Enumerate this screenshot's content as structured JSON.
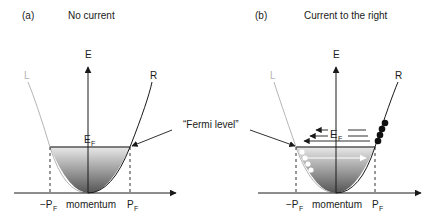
{
  "panels": [
    {
      "id": "a",
      "tag": "(a)",
      "title": "No current",
      "axis_y_label": "E",
      "branch_left": "L",
      "branch_right": "R",
      "fermi_energy": "E",
      "fermi_sub": "F",
      "neg_pf": "−P",
      "neg_pf_sub": "F",
      "pf": "P",
      "pf_sub": "F",
      "axis_x_label": "momentum"
    },
    {
      "id": "b",
      "tag": "(b)",
      "title": "Current to the right",
      "axis_y_label": "E",
      "branch_left": "L",
      "branch_right": "R",
      "fermi_energy": "E",
      "fermi_sub": "F",
      "neg_pf": "−P",
      "neg_pf_sub": "F",
      "pf": "P",
      "pf_sub": "F",
      "axis_x_label": "momentum"
    }
  ],
  "annotation": {
    "text": "“Fermi level”"
  },
  "colors": {
    "axis": "#1a1a1a",
    "left_branch": "#b5b5b5",
    "right_branch": "#1a1a1a",
    "fill_top": "#e6e6e6",
    "fill_bottom": "#5a5a5a",
    "electron_filled": "#111111",
    "hole": "#ffffff"
  }
}
